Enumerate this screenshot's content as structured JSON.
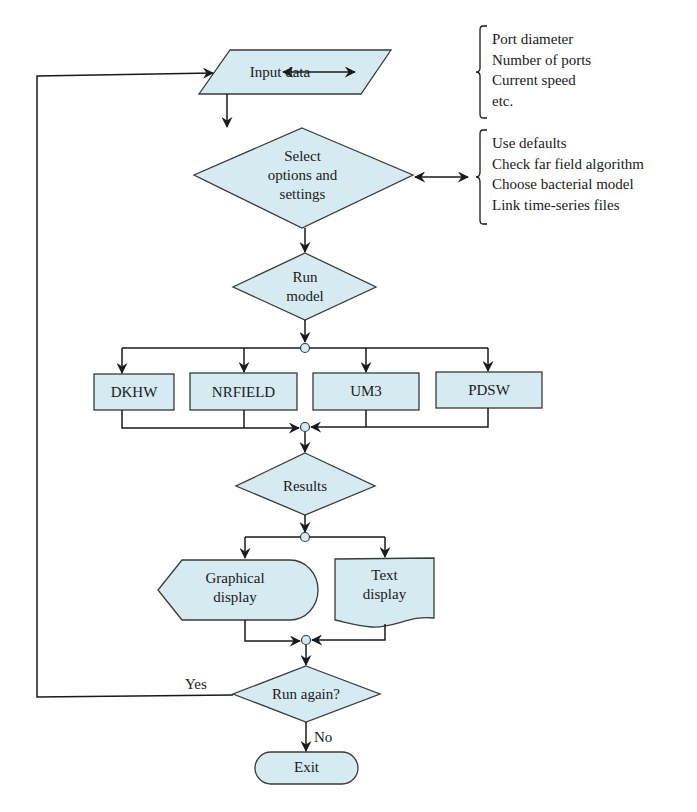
{
  "colors": {
    "shape_fill": "#d5eaf1",
    "shape_stroke": "#3a3a3a",
    "line": "#1a1a1a",
    "background": "#ffffff"
  },
  "nodes": {
    "input": {
      "label": "Input data",
      "shape": "parallelogram"
    },
    "select": {
      "label": "Select\noptions and\nsettings",
      "shape": "diamond"
    },
    "run_model": {
      "label": "Run\nmodel",
      "shape": "diamond"
    },
    "models": [
      {
        "label": "DKHW",
        "shape": "rectangle"
      },
      {
        "label": "NRFIELD",
        "shape": "rectangle"
      },
      {
        "label": "UM3",
        "shape": "rectangle"
      },
      {
        "label": "PDSW",
        "shape": "rectangle"
      }
    ],
    "results": {
      "label": "Results",
      "shape": "diamond"
    },
    "graphical": {
      "label": "Graphical\ndisplay",
      "shape": "display"
    },
    "text_display": {
      "label": "Text\ndisplay",
      "shape": "document"
    },
    "run_again": {
      "label": "Run again?",
      "shape": "diamond"
    },
    "exit": {
      "label": "Exit",
      "shape": "terminator"
    }
  },
  "annotations": {
    "input_params": [
      "Port diameter",
      "Number of ports",
      "Current speed",
      "etc."
    ],
    "options": [
      "Use defaults",
      "Check far field algorithm",
      "Choose bacterial model",
      "Link time-series files"
    ]
  },
  "edge_labels": {
    "yes": "Yes",
    "no": "No"
  }
}
